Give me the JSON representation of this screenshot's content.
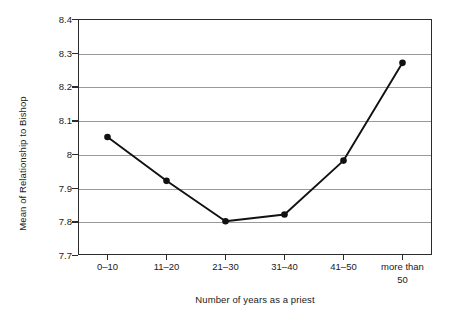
{
  "chart_data": {
    "type": "line",
    "title": "",
    "xlabel": "Number of years as a priest",
    "ylabel": "Mean of Relationship to Bishop",
    "categories": [
      "0–10",
      "11–20",
      "21–30",
      "31–40",
      "41–50",
      "more than\n50"
    ],
    "values": [
      8.05,
      7.92,
      7.8,
      7.82,
      7.98,
      8.27
    ],
    "ylim": [
      7.7,
      8.4
    ],
    "ytick_labels": [
      "8.4",
      "8.3",
      "8.2",
      "8.1",
      "8",
      "7.9",
      "7.8",
      "7.7"
    ],
    "ytick_values": [
      8.4,
      8.3,
      8.2,
      8.1,
      8.0,
      7.9,
      7.8,
      7.7
    ],
    "grid": true,
    "legend": "none",
    "marker": "filled-circle",
    "series_color": "#111111",
    "grid_color": "#9a9a9a",
    "axis_color": "#2b2b2b"
  }
}
